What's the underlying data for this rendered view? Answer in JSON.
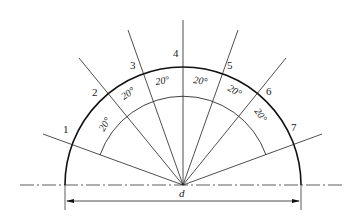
{
  "diagram": {
    "center": {
      "x": 183,
      "y": 185
    },
    "radius": 118,
    "points": [
      {
        "label": "1",
        "angle_deg": 160
      },
      {
        "label": "2",
        "angle_deg": 140
      },
      {
        "label": "3",
        "angle_deg": 120
      },
      {
        "label": "4",
        "angle_deg": 90
      },
      {
        "label": "5",
        "angle_deg": 60
      },
      {
        "label": "6",
        "angle_deg": 40
      },
      {
        "label": "7",
        "angle_deg": 20
      }
    ],
    "angle_labels": [
      "20°",
      "20°",
      "20°",
      "20°",
      "20°",
      "20°"
    ],
    "dimension_label": "d",
    "colors": {
      "line": "#1a1a1a",
      "background": "#ffffff"
    }
  }
}
